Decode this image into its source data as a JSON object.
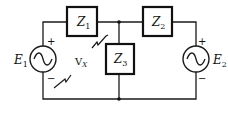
{
  "diagram": {
    "title": "",
    "type": "circuit",
    "components": {
      "z1": {
        "name": "Z",
        "sub": "1"
      },
      "z2": {
        "name": "Z",
        "sub": "2"
      },
      "z3": {
        "name": "Z",
        "sub": "3"
      },
      "e1": {
        "name": "E",
        "sub": "1",
        "plus": "+",
        "minus": "−"
      },
      "e2": {
        "name": "E",
        "sub": "2",
        "plus": "+",
        "minus": "−"
      }
    },
    "annotations": {
      "vx": {
        "name": "V",
        "sub": "X"
      }
    },
    "colors": {
      "line": "#1a1a1a",
      "background": "#ffffff"
    }
  }
}
